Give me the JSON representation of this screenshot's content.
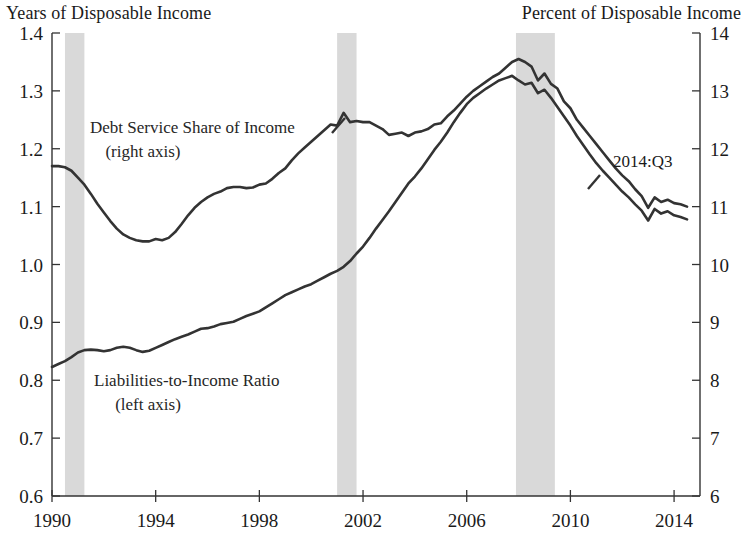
{
  "axis_titles": {
    "left": "Years of Disposable Income",
    "right": "Percent of Disposable Income"
  },
  "annotations": {
    "series_right_label_line1": "Debt Service Share of Income",
    "series_right_label_line2": "(right axis)",
    "series_left_label_line1": "Liabilities-to-Income Ratio",
    "series_left_label_line2": "(left axis)",
    "last_observation": "2014:Q3"
  },
  "colors": {
    "line": "#333333",
    "recession_shading": "#d9d9d9",
    "axis": "#333333",
    "background": "#ffffff"
  },
  "chart_data": {
    "type": "line",
    "title": "",
    "xlabel": "",
    "ylabel": "Years of Disposable Income",
    "y2label": "Percent of Disposable Income",
    "grid": false,
    "legend_position": "inline-annotations",
    "xlim": [
      1990.0,
      2015.0
    ],
    "ylim": [
      0.6,
      1.4
    ],
    "y2lim": [
      6,
      14
    ],
    "yticks": [
      "1.4",
      "1.3",
      "1.2",
      "1.1",
      "1.0",
      "0.9",
      "0.8",
      "0.7",
      "0.6"
    ],
    "ytick_values": [
      1.4,
      1.3,
      1.2,
      1.1,
      1.0,
      0.9,
      0.8,
      0.7,
      0.6
    ],
    "y2ticks": [
      "14",
      "13",
      "12",
      "11",
      "10",
      "9",
      "8",
      "7",
      "6"
    ],
    "y2tick_values": [
      14,
      13,
      12,
      11,
      10,
      9,
      8,
      7,
      6
    ],
    "xticks": [
      "1990",
      "1994",
      "1998",
      "2002",
      "2006",
      "2010",
      "2014"
    ],
    "xtick_values": [
      1990,
      1994,
      1998,
      2002,
      2006,
      2010,
      2014
    ],
    "recession_bands": [
      {
        "start": 1990.5,
        "end": 1991.25
      },
      {
        "start": 2001.0,
        "end": 2001.75
      },
      {
        "start": 2007.9,
        "end": 2009.4
      }
    ],
    "series": [
      {
        "name": "Liabilities-to-Income Ratio",
        "axis": "left",
        "units": "years of disposable income",
        "x": [
          1990.0,
          1990.25,
          1990.5,
          1990.75,
          1991.0,
          1991.25,
          1991.5,
          1991.75,
          1992.0,
          1992.25,
          1992.5,
          1992.75,
          1993.0,
          1993.25,
          1993.5,
          1993.75,
          1994.0,
          1994.25,
          1994.5,
          1994.75,
          1995.0,
          1995.25,
          1995.5,
          1995.75,
          1996.0,
          1996.25,
          1996.5,
          1996.75,
          1997.0,
          1997.25,
          1997.5,
          1997.75,
          1998.0,
          1998.25,
          1998.5,
          1998.75,
          1999.0,
          1999.25,
          1999.5,
          1999.75,
          2000.0,
          2000.25,
          2000.5,
          2000.75,
          2001.0,
          2001.25,
          2001.5,
          2001.75,
          2002.0,
          2002.25,
          2002.5,
          2002.75,
          2003.0,
          2003.25,
          2003.5,
          2003.75,
          2004.0,
          2004.25,
          2004.5,
          2004.75,
          2005.0,
          2005.25,
          2005.5,
          2005.75,
          2006.0,
          2006.25,
          2006.5,
          2006.75,
          2007.0,
          2007.25,
          2007.5,
          2007.75,
          2008.0,
          2008.25,
          2008.5,
          2008.75,
          2009.0,
          2009.25,
          2009.5,
          2009.75,
          2010.0,
          2010.25,
          2010.5,
          2010.75,
          2011.0,
          2011.25,
          2011.5,
          2011.75,
          2012.0,
          2012.25,
          2012.5,
          2012.75,
          2013.0,
          2013.25,
          2013.5,
          2013.75,
          2014.0,
          2014.25,
          2014.5
        ],
        "y": [
          0.823,
          0.828,
          0.833,
          0.84,
          0.848,
          0.852,
          0.853,
          0.852,
          0.85,
          0.852,
          0.856,
          0.858,
          0.856,
          0.852,
          0.849,
          0.851,
          0.856,
          0.861,
          0.866,
          0.871,
          0.875,
          0.879,
          0.884,
          0.889,
          0.89,
          0.893,
          0.897,
          0.899,
          0.901,
          0.906,
          0.911,
          0.915,
          0.919,
          0.926,
          0.933,
          0.94,
          0.947,
          0.952,
          0.957,
          0.962,
          0.966,
          0.972,
          0.978,
          0.984,
          0.989,
          0.996,
          1.006,
          1.019,
          1.031,
          1.046,
          1.062,
          1.077,
          1.092,
          1.108,
          1.124,
          1.14,
          1.152,
          1.166,
          1.182,
          1.198,
          1.212,
          1.228,
          1.246,
          1.262,
          1.277,
          1.288,
          1.296,
          1.304,
          1.311,
          1.318,
          1.322,
          1.326,
          1.318,
          1.311,
          1.314,
          1.296,
          1.302,
          1.288,
          1.272,
          1.256,
          1.24,
          1.222,
          1.206,
          1.19,
          1.175,
          1.162,
          1.15,
          1.138,
          1.126,
          1.116,
          1.104,
          1.093,
          1.076,
          1.096,
          1.088,
          1.092,
          1.085,
          1.082,
          1.078
        ]
      },
      {
        "name": "Debt Service Share of Income",
        "axis": "right",
        "units": "percent of disposable income",
        "x": [
          1990.0,
          1990.25,
          1990.5,
          1990.75,
          1991.0,
          1991.25,
          1991.5,
          1991.75,
          1992.0,
          1992.25,
          1992.5,
          1992.75,
          1993.0,
          1993.25,
          1993.5,
          1993.75,
          1994.0,
          1994.25,
          1994.5,
          1994.75,
          1995.0,
          1995.25,
          1995.5,
          1995.75,
          1996.0,
          1996.25,
          1996.5,
          1996.75,
          1997.0,
          1997.25,
          1997.5,
          1997.75,
          1998.0,
          1998.25,
          1998.5,
          1998.75,
          1999.0,
          1999.25,
          1999.5,
          1999.75,
          2000.0,
          2000.25,
          2000.5,
          2000.75,
          2001.0,
          2001.25,
          2001.5,
          2001.75,
          2002.0,
          2002.25,
          2002.5,
          2002.75,
          2003.0,
          2003.25,
          2003.5,
          2003.75,
          2004.0,
          2004.25,
          2004.5,
          2004.75,
          2005.0,
          2005.25,
          2005.5,
          2005.75,
          2006.0,
          2006.25,
          2006.5,
          2006.75,
          2007.0,
          2007.25,
          2007.5,
          2007.75,
          2008.0,
          2008.25,
          2008.5,
          2008.75,
          2009.0,
          2009.25,
          2009.5,
          2009.75,
          2010.0,
          2010.25,
          2010.5,
          2010.75,
          2011.0,
          2011.25,
          2011.5,
          2011.75,
          2012.0,
          2012.25,
          2012.5,
          2012.75,
          2013.0,
          2013.25,
          2013.5,
          2013.75,
          2014.0,
          2014.25,
          2014.5
        ],
        "y": [
          11.7,
          11.7,
          11.68,
          11.62,
          11.5,
          11.38,
          11.22,
          11.05,
          10.9,
          10.75,
          10.62,
          10.52,
          10.46,
          10.42,
          10.4,
          10.4,
          10.44,
          10.42,
          10.46,
          10.56,
          10.7,
          10.85,
          10.98,
          11.08,
          11.16,
          11.22,
          11.26,
          11.32,
          11.34,
          11.34,
          11.32,
          11.33,
          11.38,
          11.4,
          11.48,
          11.58,
          11.66,
          11.8,
          11.92,
          12.02,
          12.12,
          12.22,
          12.32,
          12.42,
          12.4,
          12.62,
          12.46,
          12.48,
          12.46,
          12.46,
          12.4,
          12.34,
          12.24,
          12.26,
          12.28,
          12.22,
          12.28,
          12.3,
          12.34,
          12.42,
          12.44,
          12.56,
          12.66,
          12.78,
          12.9,
          13.0,
          13.08,
          13.16,
          13.24,
          13.3,
          13.4,
          13.5,
          13.55,
          13.5,
          13.42,
          13.18,
          13.3,
          13.12,
          13.04,
          12.82,
          12.7,
          12.5,
          12.36,
          12.22,
          12.08,
          11.94,
          11.8,
          11.66,
          11.54,
          11.44,
          11.3,
          11.18,
          10.98,
          11.16,
          11.08,
          11.12,
          11.06,
          11.04,
          11.0
        ]
      }
    ]
  }
}
